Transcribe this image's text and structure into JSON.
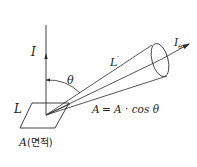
{
  "diagram": {
    "labels": {
      "intensity_normal": "I",
      "luminance_surface": "L",
      "area_label": "A",
      "area_korean": "(면적)",
      "angle": "θ",
      "luminance_direction": "L",
      "luminance_prime": "′",
      "intensity_theta": "I",
      "intensity_theta_sub": "θ",
      "projected_area_lhs": "A",
      "projected_area_prime": "′",
      "projected_area_eq": "= A · cos θ"
    },
    "colors": {
      "stroke": "#2a2a2a",
      "background": "#ffffff"
    }
  }
}
